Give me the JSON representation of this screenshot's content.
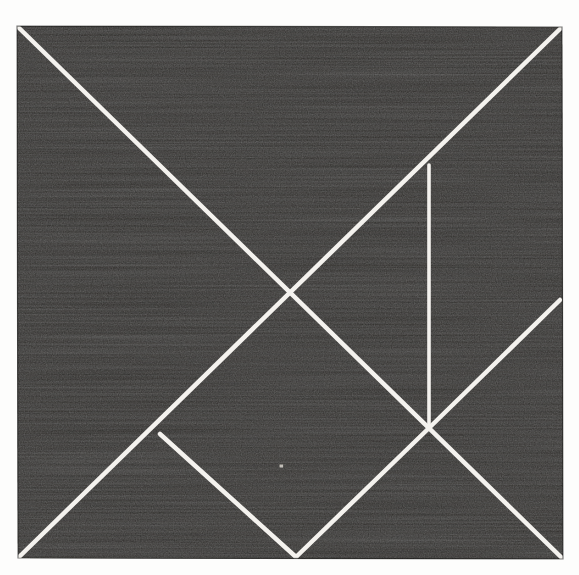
{
  "document": {
    "kind": "scanned-figure",
    "title": "Tangram Dissection of a Square",
    "canvas": {
      "width": 579,
      "height": 575
    },
    "paper_color": "#fdfdfc"
  },
  "figure": {
    "name": "tangram-square",
    "fill_color": "#1b1a19",
    "line_color": "#f4f2ee",
    "line_width": 4.5,
    "square": {
      "top_left": [
        17,
        26
      ],
      "top_right": [
        562,
        27
      ],
      "bottom_right": [
        563,
        559
      ],
      "bottom_left": [
        18,
        558
      ],
      "width": 545,
      "height": 533
    },
    "vertices": {
      "corner_tl": [
        17,
        26
      ],
      "corner_tr": [
        562,
        27
      ],
      "corner_br": [
        563,
        559
      ],
      "corner_bl": [
        18,
        558
      ],
      "center": [
        292,
        298
      ],
      "vertical_top": [
        429,
        165
      ],
      "junction": [
        429,
        428
      ],
      "right_edge": [
        560,
        300
      ],
      "left_branch": [
        160,
        434
      ],
      "bottom_apex": [
        296,
        557
      ]
    },
    "cuts": [
      {
        "name": "main-diagonal",
        "from": [
          17,
          26
        ],
        "to": [
          563,
          559
        ],
        "note": "top-left corner to bottom-right corner"
      },
      {
        "name": "anti-diagonal",
        "from": [
          562,
          27
        ],
        "to": [
          18,
          558
        ],
        "note": "top-right corner to bottom-left corner, crosses center"
      },
      {
        "name": "vertical-cut",
        "from": [
          429,
          165
        ],
        "to": [
          429,
          428
        ],
        "note": "vertical drop from main diagonal to junction"
      },
      {
        "name": "junction-to-right-edge",
        "from": [
          429,
          428
        ],
        "to": [
          560,
          300
        ],
        "note": "45 degree rise to right edge"
      },
      {
        "name": "vee-left-leg",
        "from": [
          160,
          434
        ],
        "to": [
          296,
          557
        ],
        "note": "from anti-diagonal down to bottom edge apex"
      },
      {
        "name": "vee-right-leg",
        "from": [
          296,
          557
        ],
        "to": [
          429,
          428
        ],
        "note": "from bottom edge apex up to junction"
      }
    ],
    "pieces": [
      {
        "name": "large-triangle-upper-left",
        "label": "large triangle"
      },
      {
        "name": "large-triangle-lower-left",
        "label": "large triangle"
      },
      {
        "name": "medium-triangle-right",
        "label": "medium triangle"
      },
      {
        "name": "small-triangle-upper-right",
        "label": "small triangle"
      },
      {
        "name": "small-triangle-lower-center",
        "label": "small triangle"
      },
      {
        "name": "square-piece",
        "label": "square"
      },
      {
        "name": "parallelogram-piece",
        "label": "parallelogram"
      }
    ],
    "artifacts": [
      {
        "name": "scan-speck",
        "at": [
          281,
          466
        ],
        "size": 3,
        "color": "#cfcbc4"
      }
    ]
  }
}
